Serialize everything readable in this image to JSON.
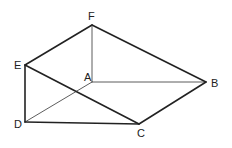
{
  "diagram": {
    "type": "geometric-solid",
    "points": {
      "A": {
        "x": 92,
        "y": 82,
        "label": "A",
        "lx": 84,
        "ly": 81
      },
      "B": {
        "x": 206,
        "y": 82,
        "label": "B",
        "lx": 211,
        "ly": 87
      },
      "C": {
        "x": 139,
        "y": 124,
        "label": "C",
        "lx": 137,
        "ly": 137
      },
      "D": {
        "x": 25,
        "y": 122,
        "label": "D",
        "lx": 14,
        "ly": 128
      },
      "E": {
        "x": 25,
        "y": 65,
        "label": "E",
        "lx": 14,
        "ly": 69
      },
      "F": {
        "x": 92,
        "y": 25,
        "label": "F",
        "lx": 88,
        "ly": 20
      }
    },
    "edges": [
      {
        "from": "F",
        "to": "E",
        "style": "thick"
      },
      {
        "from": "F",
        "to": "B",
        "style": "thick"
      },
      {
        "from": "F",
        "to": "A",
        "style": "thin"
      },
      {
        "from": "E",
        "to": "D",
        "style": "thick"
      },
      {
        "from": "E",
        "to": "C",
        "style": "thick"
      },
      {
        "from": "A",
        "to": "B",
        "style": "thin"
      },
      {
        "from": "A",
        "to": "D",
        "style": "thin"
      },
      {
        "from": "D",
        "to": "C",
        "style": "thick"
      },
      {
        "from": "C",
        "to": "B",
        "style": "thick"
      }
    ]
  }
}
